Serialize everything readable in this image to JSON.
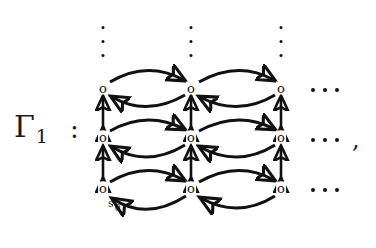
{
  "figure": {
    "label": "Γ",
    "label_subscript": "1",
    "colon": ":",
    "trailing_comma": ",",
    "node_glyph": "o",
    "start_state": {
      "symbol": "s",
      "subscript": "0"
    },
    "ellipsis_dot": "",
    "ink_color": "#111111",
    "background_color": "#ffffff"
  },
  "graph": {
    "type": "grid-automaton",
    "columns": 3,
    "rows": 3,
    "node_positions": [
      {
        "col": 0,
        "row": 0,
        "x": 103,
        "y": 88
      },
      {
        "col": 1,
        "row": 0,
        "x": 191,
        "y": 88
      },
      {
        "col": 2,
        "row": 0,
        "x": 281,
        "y": 88
      },
      {
        "col": 0,
        "row": 1,
        "x": 103,
        "y": 137
      },
      {
        "col": 1,
        "row": 1,
        "x": 191,
        "y": 137
      },
      {
        "col": 2,
        "row": 1,
        "x": 281,
        "y": 137
      },
      {
        "col": 0,
        "row": 2,
        "x": 103,
        "y": 188
      },
      {
        "col": 1,
        "row": 2,
        "x": 191,
        "y": 188
      },
      {
        "col": 2,
        "row": 2,
        "x": 281,
        "y": 188
      }
    ],
    "horizontal_edges": "bidirectional curved arrow pairs forming lens shapes",
    "vertical_edges": "double-headed straight arrows",
    "continuation_up": "vertical dots above each column",
    "continuation_right": "horizontal ellipsis right of each row"
  },
  "annotations": {
    "vertical_dot_columns": [
      103,
      191,
      281
    ],
    "horizontal_ellipsis_rows": [
      88,
      140,
      188
    ]
  }
}
